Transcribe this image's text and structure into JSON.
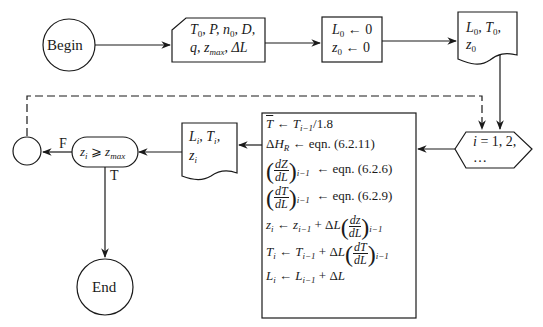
{
  "diagram": {
    "type": "flowchart",
    "nodes": {
      "begin": {
        "shape": "terminal-circle",
        "label": "Begin"
      },
      "input": {
        "shape": "manual-input",
        "line1": "T0, P, n0, D,",
        "line2": "q, zmax, ΔL",
        "items": [
          "T0",
          "P",
          "n0",
          "D",
          "q",
          "zmax",
          "ΔL"
        ]
      },
      "init": {
        "shape": "process",
        "line1": "L0 ← 0",
        "line2": "z0 ← 0"
      },
      "output_initial": {
        "shape": "document",
        "line1": "L0, T0,",
        "line2": "z0"
      },
      "loop": {
        "shape": "hexagon-loop",
        "line1": "i = 1, 2,",
        "line2": "…"
      },
      "process": {
        "shape": "process",
        "lines": [
          "T̄ ← T(i−1)/1.8",
          "ΔH_R ← eqn. (6.2.11)",
          "(dZ/dL)_(i−1) ← eqn. (6.2.6)",
          "(dT/dL)_(i−1) ← eqn. (6.2.9)",
          "z_i ← z_(i−1) + ΔL (dz/dL)_(i−1)",
          "T_i ← T_(i−1) + ΔL (dT/dL)_(i−1)",
          "L_i ← L_(i−1) + ΔL"
        ],
        "eqn_refs": [
          "eqn. (6.2.11)",
          "eqn. (6.2.6)",
          "eqn. (6.2.9)"
        ],
        "divisor": "1.8"
      },
      "output_step": {
        "shape": "document",
        "line1": "Li, Ti,",
        "line2": "zi"
      },
      "decision": {
        "shape": "decision-rounded",
        "label": "zi ⩾ zmax"
      },
      "connector": {
        "shape": "connector-circle",
        "label": ""
      },
      "end": {
        "shape": "terminal-circle",
        "label": "End"
      }
    },
    "edges": [
      {
        "from": "begin",
        "to": "input",
        "style": "solid"
      },
      {
        "from": "input",
        "to": "init",
        "style": "solid"
      },
      {
        "from": "init",
        "to": "output_initial",
        "style": "solid"
      },
      {
        "from": "output_initial",
        "to": "loop",
        "style": "solid"
      },
      {
        "from": "loop",
        "to": "process",
        "style": "solid"
      },
      {
        "from": "process",
        "to": "output_step",
        "style": "solid"
      },
      {
        "from": "output_step",
        "to": "decision",
        "style": "solid"
      },
      {
        "from": "decision",
        "to": "connector",
        "label": "F",
        "style": "solid"
      },
      {
        "from": "decision",
        "to": "end",
        "label": "T",
        "style": "solid"
      },
      {
        "from": "connector",
        "to": "loop",
        "style": "dashed"
      }
    ],
    "edge_labels": {
      "false": "F",
      "true": "T"
    },
    "colors": {
      "stroke": "#1a1a1a",
      "background": "#ffffff"
    }
  }
}
